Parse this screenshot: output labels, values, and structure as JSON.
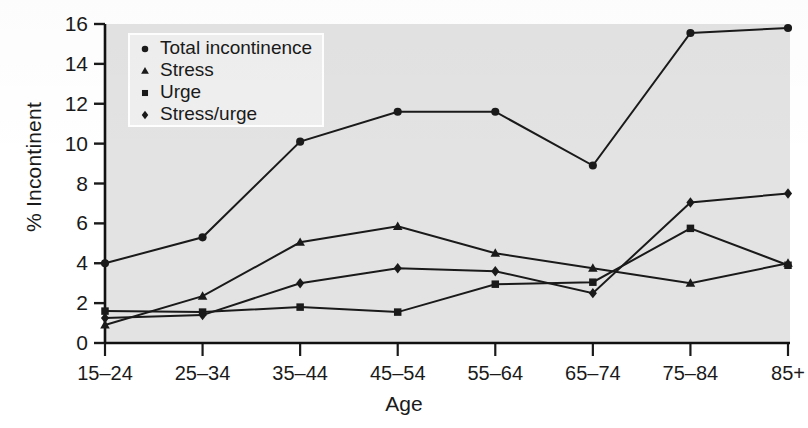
{
  "chart_data": {
    "type": "line",
    "title": "",
    "xlabel": "Age",
    "ylabel": "% Incontinent",
    "categories": [
      "15–24",
      "25–34",
      "35–44",
      "45–54",
      "55–64",
      "65–74",
      "75–84",
      "85+"
    ],
    "ylim": [
      0,
      16
    ],
    "yticks": [
      0,
      2,
      4,
      6,
      8,
      10,
      12,
      14,
      16
    ],
    "grid": false,
    "legend_position": "top-left",
    "series": [
      {
        "name": "Total incontinence",
        "marker": "circle",
        "values": [
          4.0,
          5.3,
          10.1,
          11.6,
          11.6,
          8.9,
          15.55,
          15.8
        ]
      },
      {
        "name": "Stress",
        "marker": "triangle",
        "values": [
          0.9,
          2.35,
          5.05,
          5.85,
          4.5,
          3.75,
          3.0,
          4.0
        ]
      },
      {
        "name": "Urge",
        "marker": "square",
        "values": [
          1.6,
          1.55,
          1.8,
          1.55,
          2.95,
          3.05,
          5.75,
          3.9
        ]
      },
      {
        "name": "Stress/urge",
        "marker": "diamond",
        "values": [
          1.25,
          1.4,
          3.0,
          3.75,
          3.6,
          2.5,
          7.05,
          7.5
        ]
      }
    ]
  },
  "legend": {
    "items": [
      {
        "label": "Total incontinence",
        "marker": "circle"
      },
      {
        "label": "Stress",
        "marker": "triangle"
      },
      {
        "label": "Urge",
        "marker": "square"
      },
      {
        "label": "Stress/urge",
        "marker": "diamond"
      }
    ]
  },
  "colors": {
    "ink": "#1a1a1a",
    "plot_background": "#e3e3e3",
    "legend_background": "#efefef",
    "page_background": "#ffffff"
  }
}
